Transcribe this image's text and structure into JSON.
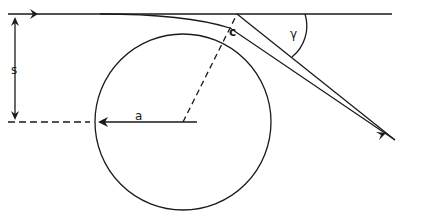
{
  "diagram": {
    "type": "geometry",
    "labels": {
      "impact_parameter": "s",
      "radius": "a",
      "contact_point": "c",
      "deflection_angle": "γ"
    },
    "colors": {
      "stroke": "#1a1a1a",
      "background": "#ffffff"
    }
  }
}
